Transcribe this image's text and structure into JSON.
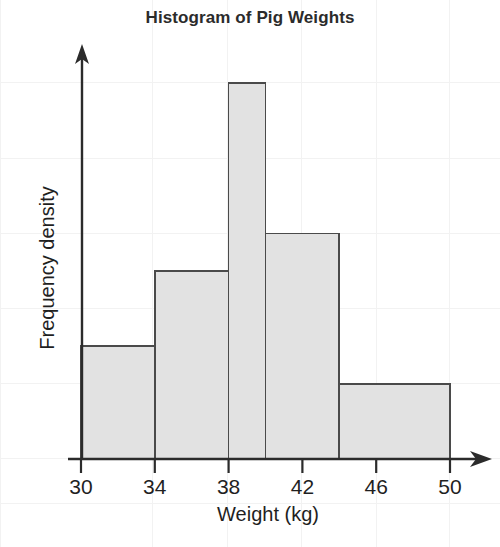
{
  "chart_data": {
    "type": "bar",
    "title": "Histogram of Pig Weights",
    "xlabel": "Weight (kg)",
    "ylabel": "Frequency density",
    "xlim": [
      30,
      50
    ],
    "ylim": [
      0,
      5.2
    ],
    "grid": true,
    "legend": null,
    "xticks": [
      30,
      34,
      38,
      42,
      46,
      50
    ],
    "xtick_labels": [
      "30",
      "34",
      "38",
      "42",
      "46",
      "50"
    ],
    "yticks": [],
    "ytick_labels": [],
    "bin_edges": [
      30,
      34,
      38,
      40,
      44,
      50
    ],
    "bins": [
      {
        "label": "30-34",
        "start": 30,
        "end": 34,
        "width": 4,
        "density": 1.5,
        "frequency": 6
      },
      {
        "label": "34-38",
        "start": 34,
        "end": 38,
        "width": 4,
        "density": 2.5,
        "frequency": 10
      },
      {
        "label": "38-40",
        "start": 38,
        "end": 40,
        "width": 2,
        "density": 5.0,
        "frequency": 10
      },
      {
        "label": "40-44",
        "start": 40,
        "end": 44,
        "width": 4,
        "density": 3.0,
        "frequency": 12
      },
      {
        "label": "44-50",
        "start": 44,
        "end": 50,
        "width": 6,
        "density": 1.0,
        "frequency": 6
      }
    ],
    "categories": [
      "30-34",
      "34-38",
      "38-40",
      "40-44",
      "44-50"
    ],
    "values": [
      1.5,
      2.5,
      5.0,
      3.0,
      1.0
    ]
  },
  "style": {
    "bar_fill": "#e2e2e2",
    "bar_stroke": "#4a4a4a",
    "axis_color": "#2b2b2b",
    "grid_color": "#f0f0f0",
    "text_color": "#1f1f1f",
    "background": "#ffffff"
  },
  "axes": {
    "x_tick_labels": [
      "30",
      "34",
      "38",
      "42",
      "46",
      "50"
    ],
    "x_axis_title": "Weight (kg)",
    "y_axis_title": "Frequency density"
  }
}
